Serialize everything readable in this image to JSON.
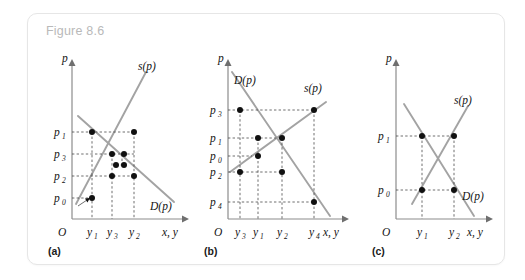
{
  "figure": {
    "title": "Figure 8.6",
    "panels": [
      {
        "id": "a",
        "caption": "(a)",
        "axes": {
          "y_axis_label": "p",
          "x_axis_label": "x, y",
          "origin_label": "O",
          "y_ticks": [
            "p1",
            "p3",
            "p2",
            "p0"
          ],
          "y_tick_text": [
            "p",
            "p",
            "p",
            "p"
          ],
          "y_tick_sub": [
            "1",
            "3",
            "2",
            "0"
          ],
          "x_ticks": [
            "y1",
            "y3",
            "y2"
          ],
          "x_tick_text": [
            "y",
            "y",
            "y"
          ],
          "x_tick_sub": [
            "1",
            "3",
            "2"
          ]
        },
        "curves": [
          {
            "name": "supply",
            "label": "s(p)",
            "slope": "upward"
          },
          {
            "name": "demand",
            "label": "D(p)",
            "slope": "downward"
          }
        ],
        "description": "Converging cobweb: prices spiral inward toward equilibrium"
      },
      {
        "id": "b",
        "caption": "(b)",
        "axes": {
          "y_axis_label": "p",
          "x_axis_label": "x, y",
          "origin_label": "O",
          "y_ticks": [
            "p3",
            "p1",
            "p0",
            "p2",
            "p4"
          ],
          "y_tick_text": [
            "p",
            "p",
            "p",
            "p",
            "p"
          ],
          "y_tick_sub": [
            "3",
            "1",
            "0",
            "2",
            "4"
          ],
          "x_ticks": [
            "y3",
            "y1",
            "y2",
            "y4"
          ],
          "x_tick_text": [
            "y",
            "y",
            "y",
            "y"
          ],
          "x_tick_sub": [
            "3",
            "1",
            "2",
            "4"
          ]
        },
        "curves": [
          {
            "name": "demand",
            "label": "D(p)",
            "slope": "downward"
          },
          {
            "name": "supply",
            "label": "s(p)",
            "slope": "upward"
          }
        ],
        "description": "Diverging cobweb: prices spiral outward away from equilibrium"
      },
      {
        "id": "c",
        "caption": "(c)",
        "axes": {
          "y_axis_label": "p",
          "x_axis_label": "x, y",
          "origin_label": "O",
          "y_ticks": [
            "p1",
            "p0"
          ],
          "y_tick_text": [
            "p",
            "p"
          ],
          "y_tick_sub": [
            "1",
            "0"
          ],
          "x_ticks": [
            "y1",
            "y2"
          ],
          "x_tick_text": [
            "y",
            "y"
          ],
          "x_tick_sub": [
            "1",
            "2"
          ]
        },
        "curves": [
          {
            "name": "supply",
            "label": "s(p)",
            "slope": "upward"
          },
          {
            "name": "demand",
            "label": "D(p)",
            "slope": "downward"
          }
        ],
        "description": "Persistent two-period oscillation between p0 and p1"
      }
    ]
  },
  "colors": {
    "curve": "#a3a3a3",
    "axis": "#8c8c8c",
    "guide": "#4a4a4a",
    "dot": "#111111",
    "title": "#b9b9b9",
    "card_border": "#e6e6e6",
    "background": "#ffffff"
  }
}
